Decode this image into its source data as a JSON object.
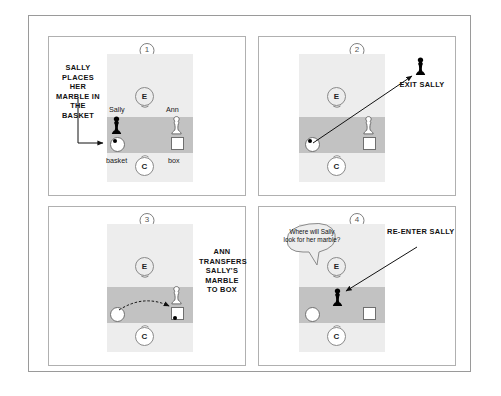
{
  "figure": {
    "title_visible": false,
    "panels": [
      {
        "number": "1",
        "caption": "SALLY PLACES HER MARBLE IN THE BASKET",
        "labels": {
          "sally": "Sally",
          "ann": "Ann",
          "basket": "basket",
          "box": "box",
          "tag_e": "E",
          "tag_c": "C"
        },
        "objects": {
          "sally_figure": "black-pawn",
          "ann_figure": "white-pawn",
          "marble_location": "basket"
        },
        "arrow": "caption-to-basket"
      },
      {
        "number": "2",
        "caption": "EXIT SALLY",
        "labels": {
          "tag_e": "E",
          "tag_c": "C"
        },
        "objects": {
          "sally_figure": "black-pawn",
          "ann_figure": "white-pawn",
          "marble_location": "basket"
        },
        "arrow": "sally-leaves-room"
      },
      {
        "number": "3",
        "caption": "ANN TRANSFERS SALLY'S MARBLE TO BOX",
        "labels": {
          "tag_e": "E",
          "tag_c": "C"
        },
        "objects": {
          "ann_figure": "white-pawn",
          "marble_location": "box"
        },
        "arrow": "marble-basket-to-box"
      },
      {
        "number": "4",
        "caption": "RE-ENTER SALLY",
        "question": "Where will Sally look for her marble?",
        "labels": {
          "tag_e": "E",
          "tag_c": "C"
        },
        "objects": {
          "sally_figure": "black-pawn",
          "marble_location": "box"
        },
        "arrow": "sally-returns-to-room"
      }
    ],
    "colors": {
      "room_fill": "#ededed",
      "table_fill": "#c2c2c2",
      "frame_stroke": "#9a9a9a",
      "panel_stroke": "#b0b0b0",
      "ink": "#111111",
      "figure_black": "#000000",
      "figure_white": "#ffffff"
    }
  }
}
